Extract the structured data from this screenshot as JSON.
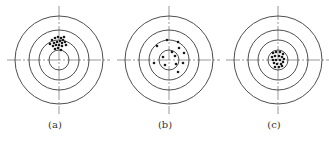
{
  "figure": {
    "colors": {
      "ring": "#3a3a3a",
      "crosshair": "#555555",
      "dot": "#1a1a1a",
      "label": "#333333"
    },
    "rings_radii": [
      10,
      20,
      30,
      44
    ],
    "panels": [
      {
        "id": "a",
        "label": "(a)",
        "offset_x": 0,
        "center": [
          59,
          60
        ],
        "dots": [
          [
            52,
            40
          ],
          [
            55,
            38
          ],
          [
            58,
            37
          ],
          [
            61,
            38
          ],
          [
            63,
            40
          ],
          [
            54,
            43
          ],
          [
            57,
            42
          ],
          [
            60,
            41
          ],
          [
            62,
            43
          ],
          [
            65,
            42
          ],
          [
            53,
            46
          ],
          [
            56,
            45
          ],
          [
            59,
            45
          ],
          [
            62,
            46
          ],
          [
            55,
            49
          ],
          [
            58,
            48
          ],
          [
            61,
            50
          ],
          [
            66,
            45
          ],
          [
            50,
            44
          ],
          [
            64,
            37
          ]
        ]
      },
      {
        "id": "b",
        "label": "(b)",
        "offset_x": 110,
        "center": [
          59,
          60
        ],
        "dots": [
          [
            47,
            46
          ],
          [
            57,
            40
          ],
          [
            68,
            42
          ],
          [
            69,
            48
          ],
          [
            62,
            52
          ],
          [
            65,
            56
          ],
          [
            74,
            53
          ],
          [
            53,
            57
          ],
          [
            44,
            63
          ],
          [
            55,
            65
          ],
          [
            66,
            64
          ],
          [
            73,
            63
          ],
          [
            68,
            72
          ]
        ]
      },
      {
        "id": "c",
        "label": "(c)",
        "offset_x": 219,
        "center": [
          59,
          60
        ],
        "dots": [
          [
            54,
            53
          ],
          [
            57,
            52
          ],
          [
            61,
            52
          ],
          [
            64,
            54
          ],
          [
            53,
            57
          ],
          [
            56,
            56
          ],
          [
            60,
            56
          ],
          [
            63,
            57
          ],
          [
            65,
            59
          ],
          [
            54,
            60
          ],
          [
            57,
            60
          ],
          [
            61,
            60
          ],
          [
            64,
            62
          ],
          [
            55,
            63
          ],
          [
            58,
            64
          ],
          [
            62,
            64
          ],
          [
            56,
            67
          ],
          [
            60,
            67
          ],
          [
            63,
            66
          ]
        ]
      }
    ]
  }
}
